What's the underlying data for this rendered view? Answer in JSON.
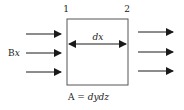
{
  "diagram": {
    "corner_labels": [
      "1",
      "2"
    ],
    "width_label": "dx",
    "incoming_flux_label": "Bx",
    "area_label_prefix": "A = ",
    "area_label_expr": "dydz",
    "incoming_arrow_count": 3,
    "outgoing_arrow_count": 3,
    "colors": {
      "stroke": "#1a1a1a",
      "box": "#555555"
    }
  }
}
